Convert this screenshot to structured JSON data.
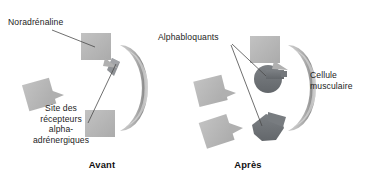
{
  "figure": {
    "title_left": "Avant",
    "title_right": "Après",
    "labels": {
      "noradrenaline": "Noradrénaline",
      "receptor_site": "Site des\nrécepteurs\nalpha-\nadrénergiques",
      "alphablockers": "Alphabloquants",
      "muscle_cell": "Cellule\nmusculaire"
    },
    "colors": {
      "background": "#ffffff",
      "molecule_square": "#b7b7b7",
      "molecule_square_dark": "#a8a8a8",
      "blocker_dark": "#6f7377",
      "membrane_outer": "#cfcfcf",
      "membrane_mid": "#9a9a9a",
      "membrane_inner": "#ededed",
      "receptor_notch": "#ffffff",
      "leader_line": "#4a4a4a",
      "text": "#1d1d1d"
    },
    "panels": [
      {
        "name": "avant",
        "caption": "Avant",
        "cell": {
          "cx": 150,
          "cy": 88,
          "rx": 34,
          "ry": 46
        },
        "receptors_open": 1,
        "receptors_bound": 1,
        "free_molecules": 3,
        "bound_molecule": "noradrenaline"
      },
      {
        "name": "apres",
        "caption": "Après",
        "cell": {
          "cx": 296,
          "cy": 88,
          "rx": 34,
          "ry": 46
        },
        "receptors_open": 1,
        "receptors_bound": 2,
        "free_molecules": 3,
        "bound_molecule": "alphabloquant"
      }
    ]
  }
}
